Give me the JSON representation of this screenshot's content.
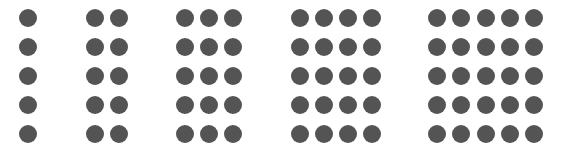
{
  "diagram": {
    "dot_color": "#545454",
    "dot_diameter": 18,
    "row_centers_y": [
      18,
      47,
      76,
      105,
      134
    ],
    "groups": [
      {
        "columns": 1,
        "rows": 5,
        "column_centers_x": [
          28
        ]
      },
      {
        "columns": 2,
        "rows": 5,
        "column_centers_x": [
          95,
          119
        ]
      },
      {
        "columns": 3,
        "rows": 5,
        "column_centers_x": [
          185,
          209,
          233
        ]
      },
      {
        "columns": 4,
        "rows": 5,
        "column_centers_x": [
          300,
          324,
          348,
          372
        ]
      },
      {
        "columns": 5,
        "rows": 5,
        "column_centers_x": [
          437,
          461,
          486,
          510,
          534
        ]
      }
    ]
  }
}
